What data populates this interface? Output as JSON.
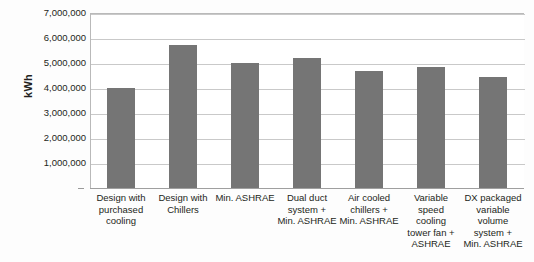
{
  "chart_data": {
    "type": "bar",
    "title": "",
    "xlabel": "",
    "ylabel": "kWh",
    "ylim": [
      0,
      7000000
    ],
    "ytick_values": [
      7000000,
      6000000,
      5000000,
      4000000,
      3000000,
      2000000,
      1000000
    ],
    "ytick_labels": [
      "7,000,000",
      "6,000,000",
      "5,000,000",
      "4,000,000",
      "3,000,000",
      "2,000,000",
      "1,000,000"
    ],
    "grid": true,
    "legend": false,
    "bar_color": "#757575",
    "categories": [
      "Design with purchased cooling",
      "Design with Chillers",
      "Min. ASHRAE",
      "Dual duct system + Min. ASHRAE",
      "Air cooled chillers + Min. ASHRAE",
      "Variable speed cooling tower fan + ASHRAE",
      "DX packaged variable volume system + Min. ASHRAE"
    ],
    "category_lines": [
      [
        "Design with",
        "purchased",
        "cooling"
      ],
      [
        "Design with",
        "Chillers"
      ],
      [
        "Min. ASHRAE"
      ],
      [
        "Dual duct",
        "system +",
        "Min. ASHRAE"
      ],
      [
        "Air cooled",
        "chillers +",
        "Min. ASHRAE"
      ],
      [
        "Variable",
        "speed",
        "cooling",
        "tower fan +",
        "ASHRAE"
      ],
      [
        "DX packaged",
        "variable",
        "volume",
        "system +",
        "Min. ASHRAE"
      ]
    ],
    "values": [
      4000000,
      5720000,
      5000000,
      5200000,
      4680000,
      4850000,
      4450000
    ]
  }
}
